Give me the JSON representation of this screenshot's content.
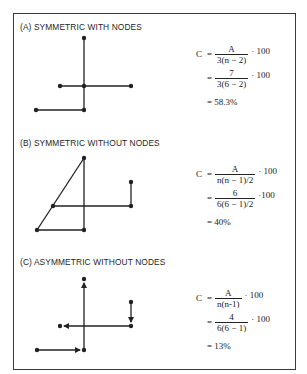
{
  "panels": [
    {
      "title": "(A) SYMMETRIC WITH NODES",
      "formula": {
        "lhs": "C",
        "line1": {
          "num": "A",
          "den": "3(n − 2)",
          "mult": "· 100"
        },
        "line2": {
          "num": "7",
          "den": "3(6 − 2)",
          "mult": "· 100"
        },
        "result": "= 58.3%"
      }
    },
    {
      "title": "(B) SYMMETRIC WITHOUT NODES",
      "formula": {
        "lhs": "C",
        "line1": {
          "num": "A",
          "den": "n(n − 1)/2",
          "mult": "· 100"
        },
        "line2": {
          "num": "6",
          "den": "6(6 − 1)/2",
          "mult": "·100"
        },
        "result": "= 40%"
      }
    },
    {
      "title": "(C) ASYMMETRIC WITHOUT NODES",
      "formula": {
        "lhs": "C",
        "line1": {
          "num": "A",
          "den": "n(n-1)",
          "mult": "· 100"
        },
        "line2": {
          "num": "4",
          "den": "6(6 − 1)",
          "mult": "· 100"
        },
        "result": "= 13%"
      }
    }
  ],
  "symbols": {
    "equals": "="
  },
  "colors": {
    "ink": "#222222",
    "frame": "#3a3a3a",
    "background": "#ffffff"
  }
}
